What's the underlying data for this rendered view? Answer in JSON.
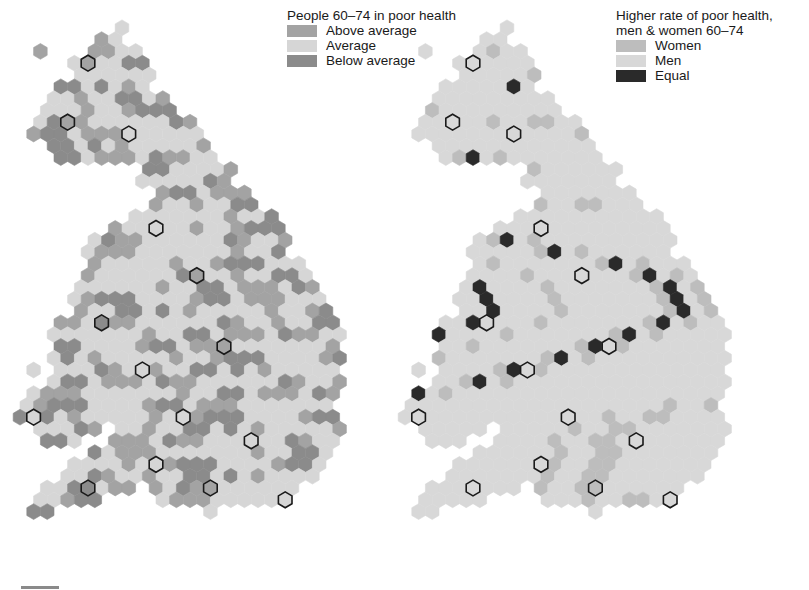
{
  "left_map": {
    "legend_title": "People 60–74 in poor health",
    "legend_items": [
      {
        "label": "Above average",
        "color": "#a3a3a3"
      },
      {
        "label": "Average",
        "color": "#d6d6d6"
      },
      {
        "label": "Below average",
        "color": "#8b8b8b"
      }
    ]
  },
  "right_map": {
    "legend_title_line1": "Higher rate of poor health,",
    "legend_title_line2": "men & women 60–74",
    "legend_items": [
      {
        "label": "Women",
        "color": "#bdbdbd"
      },
      {
        "label": "Men",
        "color": "#d8d8d8"
      },
      {
        "label": "Equal",
        "color": "#2a2a2a"
      }
    ]
  },
  "colors": {
    "outline_dark": "#1a1a1a",
    "region_border": "#ffffff"
  },
  "grid": {
    "hex_w": 13.6,
    "row_h": 11.8,
    "origin_left_x": 20,
    "origin_right_x": 405,
    "origin_y": 16,
    "rows": [
      "......................",
      ".......x..............",
      "......xx..............",
      ".x...xxxx.............",
      "....xxxxxx............",
      "....xxxxxx............",
      "...xxxxxxx............",
      "..xxxxxxxxx...........",
      "..xxxxxxxxxx..........",
      ".xxxxxxxxxxxx.........",
      ".xxxxxxxxxxxxx........",
      "..xxxxxxxxxxxx........",
      "...xxxxxxxxxxxx.......",
      ".........xxxxxxx......",
      ".........xxxxxxx......",
      "..........xxxxxxx.....",
      "..........xxxxxxxx....",
      "........xxxxxxxxxxx...",
      ".......xxxxxxxxxxxxx..",
      ".....xxxxxxxxxxxxxxx..",
      ".....xxxxxxxxxxxxxxx..",
      ".....xxxxxxxxxxxxxxxx.",
      ".....xxxxxxxxxxxxxxxxx",
      "....xxxxxxxxxxxxxxxxxx",
      "....xxxxxxxxxxxxxxxxxxx",
      "....xxxxxxxxxxxxxxxxxxx",
      "...xxxxxxxxxxxxxxxxxxxxx",
      "..xxxxxxxxxxxxxxxxxxxxxx",
      "...xxxxxxxxxxxxxxxxxxxxx",
      "..xxxxxxxxxxxxxxxxxxxxxx",
      ".x.xxxxxxxxxxxxxxxxxxxxx",
      "..xxxxxxxxxxxxxxxxxxxxxx",
      ".xxxxxxxxxxxxxxxxxxxxxxx",
      "xxxxxxxxxxxxxxxxxxxxxxx.",
      "xxxxxxxxxxxxxxxxxxxxxxxx",
      ".xxxxx.xxxxxxxxxxxxxxxxx",
      "..xxx..xxxxxxxxxxxxxxxxx",
      ".....xxxxxxxxxxxxxxxxxx.",
      "....xxxxxxxxxxxxxxxxxxx.",
      "...xxxxxxxxxxxxxxxxxxx..",
      "..xxxxxxx.xxxxxxxxxxx...",
      ".xxxxx....xxxxxxxxxx....",
      ".xx...........x.........",
      "........................"
    ],
    "left_pattern": "vvavbvvaabvvvavbbvavvvbvvavvvbavavbvvaavvbvvavbbvavvvaabvvvbav",
    "right_pattern": "mmmmwmmmmmmmwmmmmmmemmmmwmmmmmmmmwmmmmmmmmmmwmmmmmmmmmmmmemmmmmmmwmm"
  },
  "scale_bar": {
    "color": "#8a8a8a"
  }
}
